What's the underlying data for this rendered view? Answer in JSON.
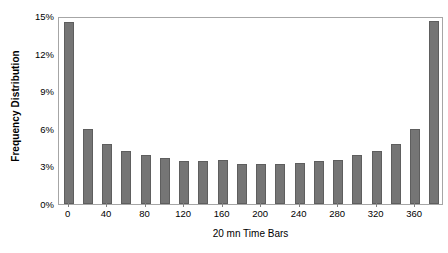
{
  "chart_data": {
    "type": "bar",
    "title": "",
    "xlabel": "20 mn Time Bars",
    "ylabel": "Frequency Distribution",
    "categories": [
      "0",
      "20",
      "40",
      "60",
      "80",
      "100",
      "120",
      "140",
      "160",
      "180",
      "200",
      "220",
      "240",
      "260",
      "280",
      "300",
      "320",
      "340",
      "360",
      "380"
    ],
    "values": [
      14.5,
      6.0,
      4.8,
      4.2,
      3.9,
      3.7,
      3.4,
      3.4,
      3.5,
      3.2,
      3.2,
      3.2,
      3.3,
      3.4,
      3.5,
      3.9,
      4.2,
      4.8,
      6.0,
      14.6
    ],
    "ylim": [
      0,
      15
    ],
    "ytick_values": [
      0,
      3,
      6,
      9,
      12,
      15
    ],
    "ytick_labels": [
      "0%",
      "3%",
      "6%",
      "9%",
      "12%",
      "15%"
    ],
    "xtick_values": [
      0,
      40,
      80,
      120,
      160,
      200,
      240,
      280,
      320,
      360
    ],
    "xtick_labels": [
      "0",
      "40",
      "80",
      "120",
      "160",
      "200",
      "240",
      "280",
      "320",
      "360"
    ],
    "xlim": [
      -10,
      390
    ],
    "grid": false,
    "legend": false,
    "bar_color": "#757575",
    "bar_edge_color": "#5e5e5e",
    "frame_color": "#a6a6a6",
    "text_color": "#000000"
  }
}
